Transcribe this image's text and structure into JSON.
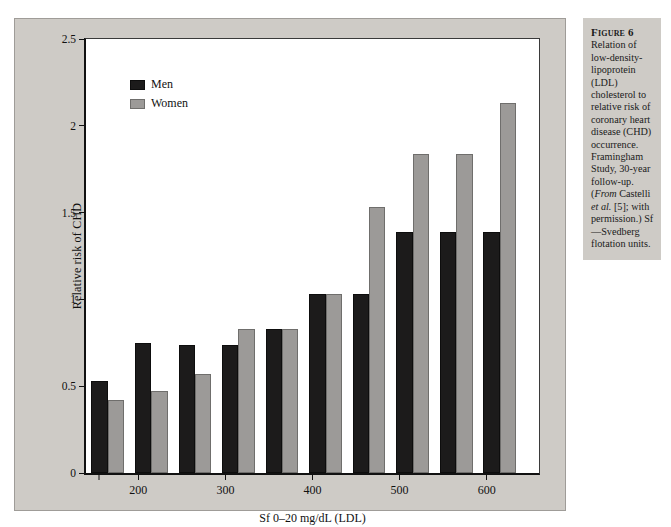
{
  "figure": {
    "caption_label": "Figure 6",
    "caption_text": "Relation of low-density-lipoprotein (LDL) cholesterol to relative risk of coronary heart disease (CHD) occurrence. Framingham Study, 30-year follow-up. (From Castelli et al. [5]; with permission.) Sf—Svedberg flotation units.",
    "panel_background": "#cecbc6",
    "plot_background": "#ffffff"
  },
  "chart_data": {
    "type": "bar",
    "title": "",
    "xlabel": "Sf 0–20 mg/dL (LDL)",
    "ylabel": "Relative risk of CHD",
    "ylim": [
      0,
      2.5
    ],
    "yticks": [
      "0",
      "0.5",
      "1",
      "1.5",
      "2",
      "2.5"
    ],
    "ytick_values": [
      0,
      0.5,
      1,
      1.5,
      2,
      2.5
    ],
    "xticks": [
      "",
      "200",
      "300",
      "400",
      "500",
      "600"
    ],
    "xtick_values": [
      155,
      200,
      300,
      400,
      500,
      600
    ],
    "xlim": [
      140,
      660
    ],
    "grid": false,
    "legend_position": "upper-left",
    "colors": {
      "men": "#1c1b1b",
      "women": "#9c9a98"
    },
    "categories": [
      165,
      215,
      265,
      315,
      365,
      415,
      465,
      515,
      565,
      615
    ],
    "series": [
      {
        "name": "Men",
        "values": [
          0.53,
          0.75,
          0.74,
          0.74,
          0.83,
          1.03,
          1.03,
          1.39,
          1.39,
          1.39
        ]
      },
      {
        "name": "Women",
        "values": [
          0.42,
          0.47,
          0.57,
          0.83,
          0.83,
          1.03,
          1.53,
          1.84,
          1.84,
          2.13
        ]
      }
    ]
  }
}
